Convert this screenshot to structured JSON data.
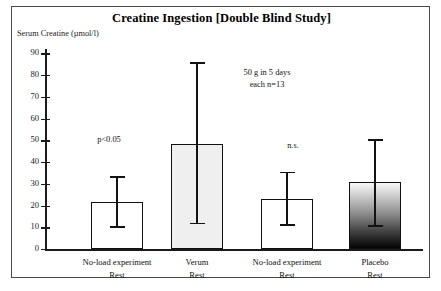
{
  "figure": {
    "title": "Creatine Ingestion [Double Blind Study]",
    "y_axis_caption": "Serum Creatine (µmol/l)"
  },
  "annotations": {
    "dose_line1": "50 g in 5 days",
    "dose_line2": "each n=13",
    "sig_bar1": "p<0.05",
    "sig_bar3": "n.s."
  },
  "chart_data": {
    "type": "bar",
    "title": "Creatine Ingestion [Double Blind Study]",
    "xlabel": "",
    "ylabel": "Serum Creatine (µmol/l)",
    "ylim": [
      0,
      92
    ],
    "yticks": [
      0,
      10,
      20,
      30,
      40,
      50,
      60,
      70,
      80,
      90
    ],
    "ytick_labels": [
      "0",
      "10",
      "20",
      "30",
      "40",
      "50",
      "60",
      "70",
      "80",
      "90"
    ],
    "grid": false,
    "legend": "none",
    "categories": [
      "No-load experiment\nRest",
      "Verum\nRest",
      "No-load experiment\nRest",
      "Placebo\nRest"
    ],
    "category_lines": [
      {
        "line1": "No-load experiment",
        "line2": "Rest"
      },
      {
        "line1": "Verum",
        "line2": "Rest"
      },
      {
        "line1": "No-load experiment",
        "line2": "Rest"
      },
      {
        "line1": "Placebo",
        "line2": "Rest"
      }
    ],
    "values": [
      21.5,
      48.5,
      23.0,
      31.0
    ],
    "error_high": [
      33.5,
      86.0,
      35.5,
      50.5
    ],
    "error_low": [
      10.5,
      12.0,
      11.5,
      11.0
    ],
    "fills": [
      "white",
      "light-gray",
      "white",
      "gradient-white-to-black"
    ],
    "fill_colors": [
      "#ffffff",
      "#efefef",
      "#ffffff",
      "#000000"
    ],
    "annotations": [
      {
        "text": "p<0.05",
        "bar_index": 0
      },
      {
        "text": "n.s.",
        "bar_index": 2
      },
      {
        "text": "50 g in 5 days",
        "position": "upper-center"
      },
      {
        "text": "each n=13",
        "position": "upper-center"
      }
    ]
  },
  "colors": {
    "axis": "#1b1b1b",
    "frame": "#4a4a4a",
    "bar_outline": "#111111",
    "text": "#101010"
  }
}
